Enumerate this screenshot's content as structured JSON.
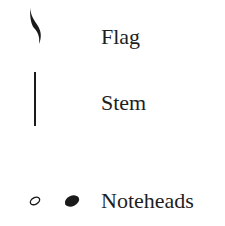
{
  "parts": [
    {
      "label": "Flag",
      "icon": "flag-icon"
    },
    {
      "label": "Stem",
      "icon": "stem-icon"
    },
    {
      "label": "Noteheads",
      "icon": "noteheads-icon"
    }
  ],
  "colors": {
    "ink": "#1a1a1a",
    "background": "#ffffff"
  }
}
